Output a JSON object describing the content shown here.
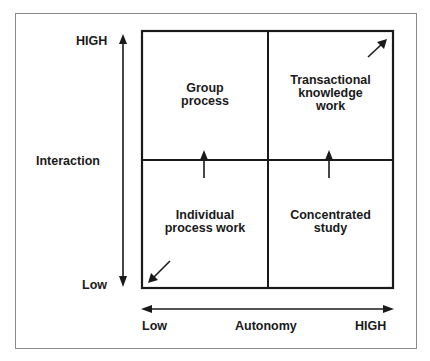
{
  "diagram": {
    "type": "2x2-quadrant-matrix",
    "y_axis": {
      "label": "Interaction",
      "high_label": "HIGH",
      "low_label": "Low"
    },
    "x_axis": {
      "label": "Autonomy",
      "high_label": "HIGH",
      "low_label": "Low"
    },
    "quadrants": {
      "top_left": {
        "label": "Group\nprocess"
      },
      "top_right": {
        "label": "Transactional\nknowledge\nwork"
      },
      "bottom_left": {
        "label": "Individual\nprocess work"
      },
      "bottom_right": {
        "label": "Concentrated\nstudy"
      }
    },
    "arrows": [
      {
        "from": "bottom_left",
        "to": "top_left",
        "direction": "up"
      },
      {
        "from": "bottom_right",
        "to": "top_right",
        "direction": "up"
      },
      {
        "corner": "bottom_left",
        "direction": "down-left"
      },
      {
        "corner": "top_right",
        "direction": "up-right"
      }
    ],
    "colors": {
      "line": "#1a1a1a",
      "frame": "#8a8a8a",
      "background": "#ffffff"
    }
  }
}
